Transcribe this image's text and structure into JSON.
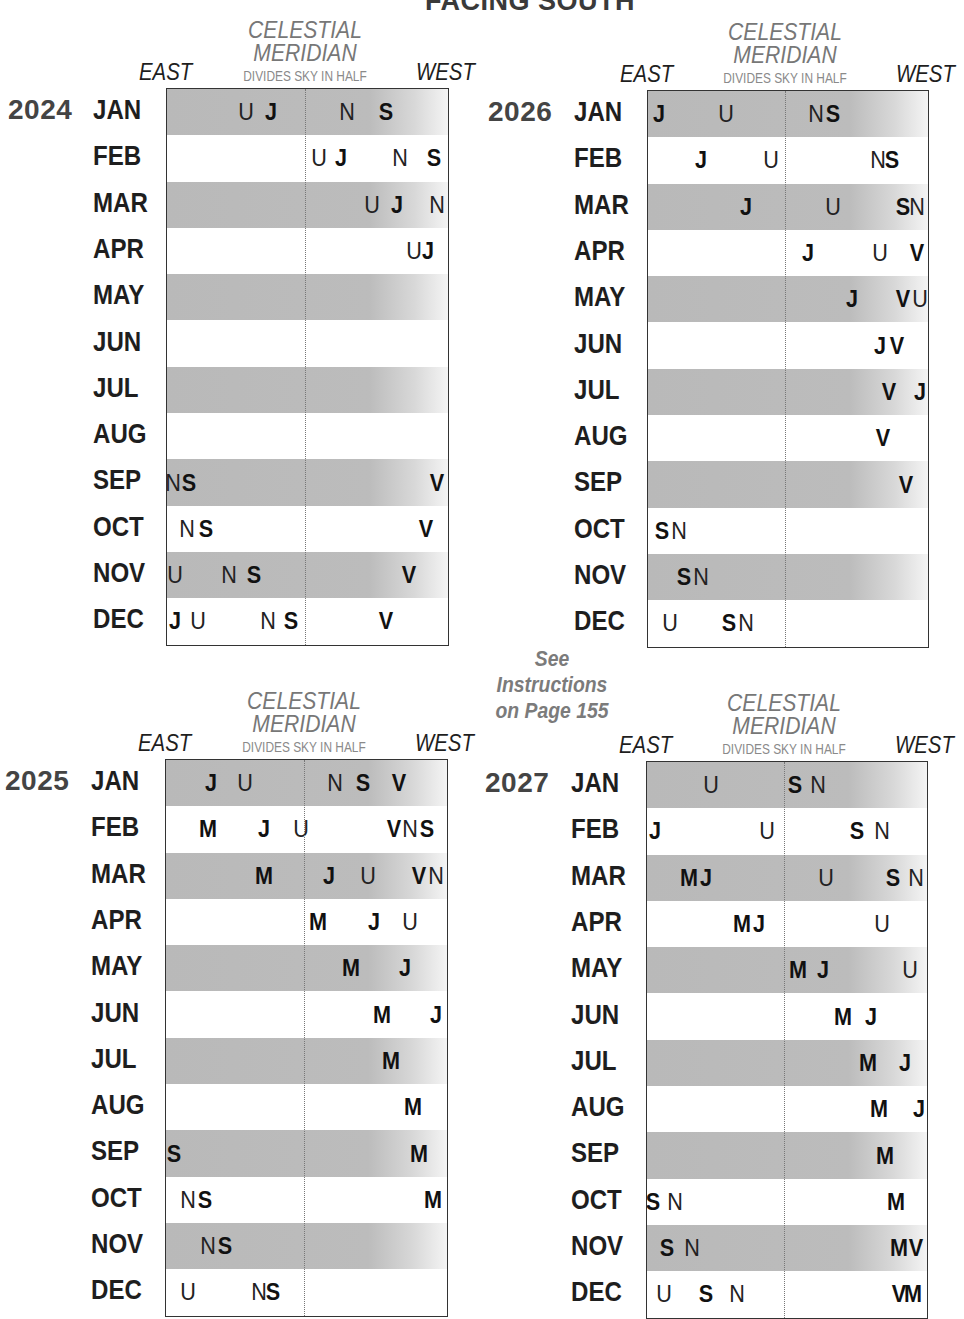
{
  "header": {
    "title": "FACING SOUTH"
  },
  "note": {
    "line1": "See",
    "line2": "Instructions",
    "line3": "on Page 155"
  },
  "labels": {
    "east": "EAST",
    "west": "WEST",
    "meridian_line1": "CELESTIAL",
    "meridian_line2": "MERIDIAN",
    "meridian_sub": "DIVIDES SKY IN HALF"
  },
  "months": [
    "JAN",
    "FEB",
    "MAR",
    "APR",
    "MAY",
    "JUN",
    "JUL",
    "AUG",
    "SEP",
    "OCT",
    "NOV",
    "DEC"
  ],
  "legend_bold": [
    "J",
    "S",
    "V",
    "M"
  ],
  "legend_regular": [
    "U",
    "N"
  ],
  "colors": {
    "shade": "#bcbcbc",
    "year": "#444444",
    "heading": "#777777",
    "note": "#7b7b7b"
  },
  "chart_data": {
    "type": "table",
    "title": "FACING SOUTH",
    "xlabel": "EAST → WEST (celestial meridian divides sky in half at 49%)",
    "units": "planet letter horizontal position as % of box width from east edge",
    "panels": [
      {
        "year": "2024",
        "rows": [
          [
            {
              "p": "U",
              "x": 28
            },
            {
              "p": "J",
              "x": 37
            },
            {
              "p": "N",
              "x": 64
            },
            {
              "p": "S",
              "x": 78
            }
          ],
          [
            {
              "p": "U",
              "x": 54
            },
            {
              "p": "J",
              "x": 62
            },
            {
              "p": "N",
              "x": 83
            },
            {
              "p": "S",
              "x": 95
            }
          ],
          [
            {
              "p": "U",
              "x": 73
            },
            {
              "p": "J",
              "x": 82
            },
            {
              "p": "N",
              "x": 96
            }
          ],
          [
            {
              "p": "U",
              "x": 88
            },
            {
              "p": "J",
              "x": 93
            }
          ],
          [],
          [],
          [],
          [],
          [
            {
              "p": "N",
              "x": 2
            },
            {
              "p": "S",
              "x": 8
            },
            {
              "p": "V",
              "x": 96
            }
          ],
          [
            {
              "p": "N",
              "x": 7
            },
            {
              "p": "S",
              "x": 14
            },
            {
              "p": "V",
              "x": 92
            }
          ],
          [
            {
              "p": "U",
              "x": 3
            },
            {
              "p": "N",
              "x": 22
            },
            {
              "p": "S",
              "x": 31
            },
            {
              "p": "V",
              "x": 86
            }
          ],
          [
            {
              "p": "J",
              "x": 3
            },
            {
              "p": "U",
              "x": 11
            },
            {
              "p": "N",
              "x": 36
            },
            {
              "p": "S",
              "x": 44
            },
            {
              "p": "V",
              "x": 78
            }
          ]
        ]
      },
      {
        "year": "2026",
        "rows": [
          [
            {
              "p": "J",
              "x": 4
            },
            {
              "p": "U",
              "x": 28
            },
            {
              "p": "N",
              "x": 60
            },
            {
              "p": "S",
              "x": 66
            }
          ],
          [
            {
              "p": "J",
              "x": 19
            },
            {
              "p": "U",
              "x": 44
            },
            {
              "p": "N",
              "x": 82
            },
            {
              "p": "S",
              "x": 87
            }
          ],
          [
            {
              "p": "J",
              "x": 35
            },
            {
              "p": "U",
              "x": 66
            },
            {
              "p": "S",
              "x": 91
            },
            {
              "p": "N",
              "x": 96
            }
          ],
          [
            {
              "p": "J",
              "x": 57
            },
            {
              "p": "U",
              "x": 83
            },
            {
              "p": "V",
              "x": 96
            }
          ],
          [
            {
              "p": "J",
              "x": 73
            },
            {
              "p": "V",
              "x": 91
            },
            {
              "p": "U",
              "x": 97
            }
          ],
          [
            {
              "p": "J",
              "x": 83
            },
            {
              "p": "V",
              "x": 89
            }
          ],
          [
            {
              "p": "V",
              "x": 86
            },
            {
              "p": "J",
              "x": 97
            }
          ],
          [
            {
              "p": "V",
              "x": 84
            }
          ],
          [
            {
              "p": "V",
              "x": 92
            }
          ],
          [
            {
              "p": "S",
              "x": 5
            },
            {
              "p": "N",
              "x": 11
            }
          ],
          [
            {
              "p": "S",
              "x": 13
            },
            {
              "p": "N",
              "x": 19
            }
          ],
          [
            {
              "p": "U",
              "x": 8
            },
            {
              "p": "S",
              "x": 29
            },
            {
              "p": "N",
              "x": 35
            }
          ]
        ]
      },
      {
        "year": "2025",
        "rows": [
          [
            {
              "p": "J",
              "x": 16
            },
            {
              "p": "U",
              "x": 28
            },
            {
              "p": "N",
              "x": 60
            },
            {
              "p": "S",
              "x": 70
            },
            {
              "p": "V",
              "x": 83
            }
          ],
          [
            {
              "p": "M",
              "x": 15
            },
            {
              "p": "J",
              "x": 35
            },
            {
              "p": "U",
              "x": 48
            },
            {
              "p": "V",
              "x": 81
            },
            {
              "p": "N",
              "x": 87
            },
            {
              "p": "S",
              "x": 93
            }
          ],
          [
            {
              "p": "M",
              "x": 35
            },
            {
              "p": "J",
              "x": 58
            },
            {
              "p": "U",
              "x": 72
            },
            {
              "p": "V",
              "x": 90
            },
            {
              "p": "N",
              "x": 96
            }
          ],
          [
            {
              "p": "M",
              "x": 54
            },
            {
              "p": "J",
              "x": 74
            },
            {
              "p": "U",
              "x": 87
            }
          ],
          [
            {
              "p": "M",
              "x": 66
            },
            {
              "p": "J",
              "x": 85
            }
          ],
          [
            {
              "p": "M",
              "x": 77
            },
            {
              "p": "J",
              "x": 96
            }
          ],
          [
            {
              "p": "M",
              "x": 80
            }
          ],
          [
            {
              "p": "M",
              "x": 88
            }
          ],
          [
            {
              "p": "S",
              "x": 3
            },
            {
              "p": "M",
              "x": 90
            }
          ],
          [
            {
              "p": "N",
              "x": 8
            },
            {
              "p": "S",
              "x": 14
            },
            {
              "p": "M",
              "x": 95
            }
          ],
          [
            {
              "p": "N",
              "x": 15
            },
            {
              "p": "S",
              "x": 21
            }
          ],
          [
            {
              "p": "U",
              "x": 8
            },
            {
              "p": "N",
              "x": 33
            },
            {
              "p": "S",
              "x": 38
            }
          ]
        ]
      },
      {
        "year": "2027",
        "rows": [
          [
            {
              "p": "U",
              "x": 23
            },
            {
              "p": "S",
              "x": 53
            },
            {
              "p": "N",
              "x": 61
            }
          ],
          [
            {
              "p": "J",
              "x": 3
            },
            {
              "p": "U",
              "x": 43
            },
            {
              "p": "S",
              "x": 75
            },
            {
              "p": "N",
              "x": 84
            }
          ],
          [
            {
              "p": "M",
              "x": 15
            },
            {
              "p": "J",
              "x": 21
            },
            {
              "p": "U",
              "x": 64
            },
            {
              "p": "S",
              "x": 88
            },
            {
              "p": "N",
              "x": 96
            }
          ],
          [
            {
              "p": "M",
              "x": 34
            },
            {
              "p": "J",
              "x": 40
            },
            {
              "p": "U",
              "x": 84
            }
          ],
          [
            {
              "p": "M",
              "x": 54
            },
            {
              "p": "J",
              "x": 63
            },
            {
              "p": "U",
              "x": 94
            }
          ],
          [
            {
              "p": "M",
              "x": 70
            },
            {
              "p": "J",
              "x": 80
            }
          ],
          [
            {
              "p": "M",
              "x": 79
            },
            {
              "p": "J",
              "x": 92
            }
          ],
          [
            {
              "p": "M",
              "x": 83
            },
            {
              "p": "J",
              "x": 97
            }
          ],
          [
            {
              "p": "M",
              "x": 85
            }
          ],
          [
            {
              "p": "S",
              "x": 2
            },
            {
              "p": "N",
              "x": 10
            },
            {
              "p": "M",
              "x": 89
            }
          ],
          [
            {
              "p": "S",
              "x": 7
            },
            {
              "p": "N",
              "x": 16
            },
            {
              "p": "M",
              "x": 90
            },
            {
              "p": "V",
              "x": 96
            }
          ],
          [
            {
              "p": "U",
              "x": 6
            },
            {
              "p": "S",
              "x": 21
            },
            {
              "p": "N",
              "x": 32
            },
            {
              "p": "V",
              "x": 90
            },
            {
              "p": "M",
              "x": 95
            }
          ]
        ]
      }
    ]
  }
}
